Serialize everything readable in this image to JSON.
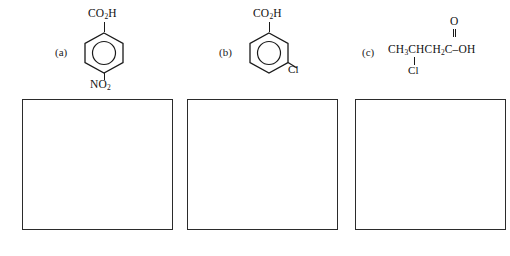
{
  "page": {
    "background_color": "#ffffff",
    "ink_color": "#1a1a1a",
    "box_border_color": "#2b2b2b"
  },
  "problems": [
    {
      "label": "(a)",
      "name": "4-nitrobenzoic-acid",
      "representation": "skeletal",
      "top_substituent": "CO",
      "top_substituent_sub": "2",
      "top_substituent_tail": "H",
      "bottom_substituent": "NO",
      "bottom_substituent_sub": "2",
      "aromatic_ring": true
    },
    {
      "label": "(b)",
      "name": "3-chlorobenzoic-acid",
      "representation": "skeletal",
      "top_substituent": "CO",
      "top_substituent_sub": "2",
      "top_substituent_tail": "H",
      "meta_substituent": "Cl",
      "aromatic_ring": true
    },
    {
      "label": "(c)",
      "name": "3-chlorobutanoic-acid",
      "representation": "condensed",
      "formula_part1": "CH",
      "formula_sub1": "3",
      "formula_part2": "CHCH",
      "formula_sub2": "2",
      "formula_carbonyl_c": "C",
      "formula_tail": "–OH",
      "carbonyl_oxygen": "O",
      "branch_substituent": "Cl"
    }
  ],
  "answer_boxes": [
    {
      "id": "answer-box-a",
      "content": ""
    },
    {
      "id": "answer-box-b",
      "content": ""
    },
    {
      "id": "answer-box-c",
      "content": ""
    }
  ]
}
